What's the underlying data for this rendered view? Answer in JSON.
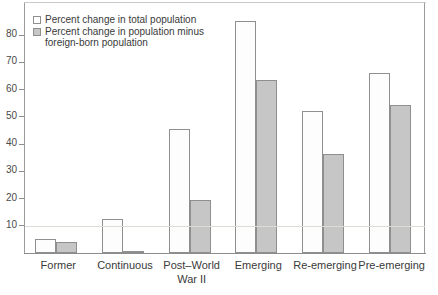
{
  "legend": {
    "position": "top-left",
    "entries": [
      {
        "key": "total",
        "label": "Percent change in total population",
        "swatch": "open-square-swatch",
        "color": "#ffffff"
      },
      {
        "key": "minus",
        "label": "Percent change in population minus\nforeign-born population",
        "swatch": "filled-square-swatch",
        "color": "#c6c6c6"
      }
    ]
  },
  "axis": {
    "y_ticks": [
      "10",
      "20",
      "30",
      "40",
      "50",
      "60",
      "70",
      "80"
    ],
    "x_labels": [
      "Former",
      "Continuous",
      "Post–World\nWar II",
      "Emerging",
      "Re-emerging",
      "Pre-emerging"
    ]
  },
  "chart_data": {
    "type": "bar",
    "title": "",
    "subtitle": "",
    "xlabel": "",
    "ylabel": "",
    "ylim": [
      0,
      88
    ],
    "yticks": [
      10,
      20,
      30,
      40,
      50,
      60,
      70,
      80
    ],
    "grid": false,
    "legend_position": "top-left",
    "categories": [
      "Former",
      "Continuous",
      "Post–World War II",
      "Emerging",
      "Re-emerging",
      "Pre-emerging"
    ],
    "series": [
      {
        "name": "Percent change in total population",
        "color": "#ffffff",
        "values": [
          5,
          12.5,
          45.5,
          85,
          52,
          66
        ]
      },
      {
        "name": "Percent change in population minus foreign-born population",
        "color": "#c6c6c6",
        "values": [
          4,
          0.5,
          19.5,
          63.5,
          36.5,
          54.5
        ]
      }
    ]
  }
}
